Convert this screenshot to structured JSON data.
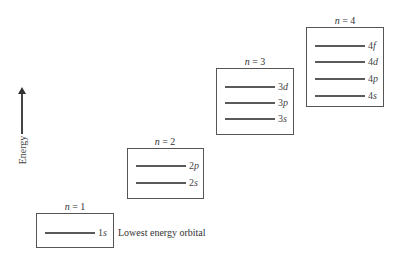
{
  "axis": {
    "label": "Energy",
    "direction": "up"
  },
  "shells": [
    {
      "n_label": "n = 1",
      "n_var": "n",
      "n_value": "1",
      "orbitals": [
        {
          "num": "1",
          "letter": "s",
          "label": "1s"
        }
      ]
    },
    {
      "n_label": "n = 2",
      "n_var": "n",
      "n_value": "2",
      "orbitals": [
        {
          "num": "2",
          "letter": "p",
          "label": "2p"
        },
        {
          "num": "2",
          "letter": "s",
          "label": "2s"
        }
      ]
    },
    {
      "n_label": "n = 3",
      "n_var": "n",
      "n_value": "3",
      "orbitals": [
        {
          "num": "3",
          "letter": "d",
          "label": "3d"
        },
        {
          "num": "3",
          "letter": "p",
          "label": "3p"
        },
        {
          "num": "3",
          "letter": "s",
          "label": "3s"
        }
      ]
    },
    {
      "n_label": "n = 4",
      "n_var": "n",
      "n_value": "4",
      "orbitals": [
        {
          "num": "4",
          "letter": "f",
          "label": "4f"
        },
        {
          "num": "4",
          "letter": "d",
          "label": "4d"
        },
        {
          "num": "4",
          "letter": "p",
          "label": "4p"
        },
        {
          "num": "4",
          "letter": "s",
          "label": "4s"
        }
      ]
    }
  ],
  "annotation": {
    "text": "Lowest energy orbital",
    "target": "1s"
  },
  "colors": {
    "line": "#5a5a5a",
    "box_border": "#555555",
    "text": "#333333"
  }
}
